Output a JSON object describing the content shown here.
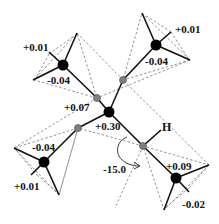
{
  "diagram": {
    "type": "molecular-structure",
    "labels": {
      "methyl_tl_h": "+0.01",
      "methyl_tl_c": "-0.04",
      "methyl_tr_h": "+0.01",
      "methyl_tr_c": "-0.04",
      "methyl_bl_c": "-0.04",
      "methyl_bl_h": "+0.01",
      "methyl_br_c": "+0.09",
      "methyl_br_h": "-0.02",
      "si_gray": "+0.07",
      "central_c": "+0.30",
      "hydrogen": "H",
      "torsion_angle": "-15.0"
    },
    "colors": {
      "atom_black": "#000000",
      "atom_gray": "#808080",
      "bond": "#111111",
      "dashed": "#777777"
    }
  }
}
